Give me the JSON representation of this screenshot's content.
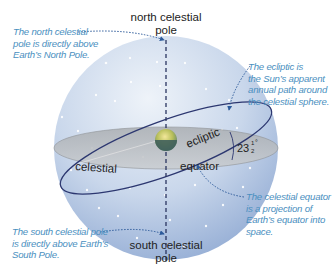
{
  "labels": {
    "north_pole": "north celestial\npole",
    "north_pole_line1": "north celestial",
    "north_pole_line2": "pole",
    "south_pole_line1": "south celestial",
    "south_pole_line2": "pole",
    "celestial": "celestial",
    "equator": "equator",
    "ecliptic": "ecliptic",
    "angle": "23",
    "angle_fraction_num": "1",
    "angle_fraction_den": "2",
    "angle_unit": "°"
  },
  "annotations": {
    "north": [
      "The north celestial",
      "pole is directly above",
      "Earth’s North Pole."
    ],
    "ecliptic": [
      "The ecliptic is",
      "the Sun’s apparent",
      "annual path around",
      "the celestial sphere."
    ],
    "equator": [
      "The celestial equator",
      "is a projection of",
      "Earth’s equator into",
      "space."
    ],
    "south": [
      "The south celestial pole",
      "is directly above Earth’s",
      "South Pole."
    ]
  },
  "colors": {
    "sphere_light": "#e6edf6",
    "sphere_dark": "#9db5d8",
    "plane": "#b9bcbf",
    "ecliptic_line": "#2c3770",
    "annotation": "#4a8fc0",
    "pole_axis": "#2a3560"
  }
}
